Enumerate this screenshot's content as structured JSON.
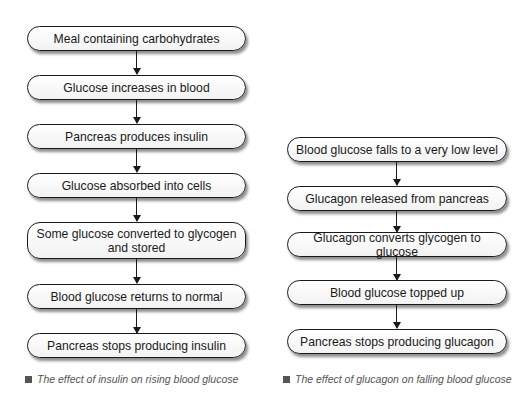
{
  "insulin_flow": {
    "steps": [
      "Meal containing carbohydrates",
      "Glucose increases in blood",
      "Pancreas produces insulin",
      "Glucose absorbed into cells",
      "Some glucose converted to glycogen and stored",
      "Blood glucose returns to normal",
      "Pancreas stops producing insulin"
    ],
    "caption": "The effect of insulin on rising blood glucose"
  },
  "glucagon_flow": {
    "steps": [
      "Blood glucose falls to a very low level",
      "Glucagon released from pancreas",
      "Glucagon converts glycogen to glucose",
      "Blood glucose topped up",
      "Pancreas stops producing glucagon"
    ],
    "caption": "The effect of glucagon on falling blood glucose"
  },
  "colors": {
    "border": "#1a1a1a",
    "caption": "#555555",
    "background": "#ffffff"
  }
}
